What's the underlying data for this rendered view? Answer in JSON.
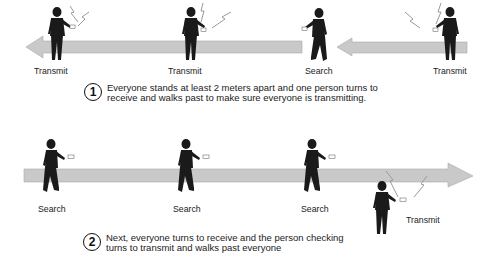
{
  "colors": {
    "arrow": "#c9c9c9",
    "arrow_stroke": "#a8a8a8",
    "figure": "#1a1a1a",
    "signal": "#9a9a9a"
  },
  "scene1": {
    "arrow_direction": "left",
    "people": [
      {
        "label": "Transmit",
        "mode": "transmit"
      },
      {
        "label": "Transmit",
        "mode": "transmit"
      },
      {
        "label": "Search",
        "mode": "search"
      },
      {
        "label": "Transmit",
        "mode": "transmit"
      }
    ],
    "step_number": "1",
    "step_text": "Everyone stands at least 2 meters apart and one person turns to receive and walks past to make sure everyone is transmitting."
  },
  "scene2": {
    "arrow_direction": "right",
    "people": [
      {
        "label": "Search",
        "mode": "search"
      },
      {
        "label": "Search",
        "mode": "search"
      },
      {
        "label": "Search",
        "mode": "search"
      },
      {
        "label": "Transmit",
        "mode": "transmit"
      }
    ],
    "step_number": "2",
    "step_text": "Next, everyone turns to receive and the person checking turns to transmit and walks past everyone"
  }
}
